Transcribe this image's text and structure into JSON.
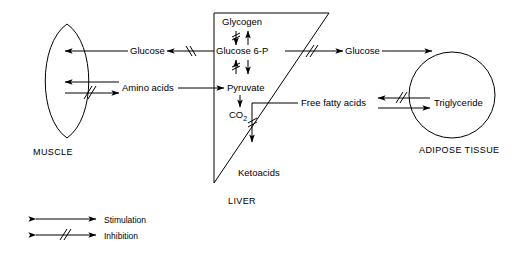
{
  "diagram": {
    "title_visible": false,
    "organs": [
      {
        "id": "muscle",
        "label": "MUSCLE"
      },
      {
        "id": "liver",
        "label": "LIVER"
      },
      {
        "id": "adipose",
        "label": "ADIPOSE TISSUE"
      }
    ],
    "metabolites": [
      {
        "id": "glucose-muscle",
        "label": "Glucose"
      },
      {
        "id": "amino-acids",
        "label": "Amino acids"
      },
      {
        "id": "glycogen",
        "label": "Glycogen"
      },
      {
        "id": "glucose-6-p",
        "label": "Glucose 6-P"
      },
      {
        "id": "pyruvate",
        "label": "Pyruvate"
      },
      {
        "id": "co2",
        "label": "CO",
        "subscript": "2"
      },
      {
        "id": "ketoacids",
        "label": "Ketoacids"
      },
      {
        "id": "glucose-adipose",
        "label": "Glucose"
      },
      {
        "id": "free-fatty-acids",
        "label": "Free fatty acids"
      },
      {
        "id": "triglyceride",
        "label": "Triglyceride"
      }
    ],
    "legend": [
      {
        "id": "stimulation",
        "label": "Stimulation",
        "marker": "arrow"
      },
      {
        "id": "inhibition",
        "label": "Inhibition",
        "marker": "arrow-hatched"
      }
    ],
    "arrows": [
      {
        "id": "g6p-to-glucose-muscle",
        "from": "glucose-6-p",
        "to": "glucose-muscle",
        "type": "inhibition"
      },
      {
        "id": "glucose-muscle-to-muscle",
        "from": "glucose-muscle",
        "to": "muscle",
        "type": "stimulation"
      },
      {
        "id": "aminoacids-to-pyruvate",
        "from": "amino-acids",
        "to": "pyruvate",
        "type": "stimulation"
      },
      {
        "id": "muscle-to-aminoacids",
        "from": "muscle",
        "to": "amino-acids",
        "type": "stimulation"
      },
      {
        "id": "aminoacids-to-muscle",
        "from": "amino-acids",
        "to": "muscle",
        "type": "inhibition"
      },
      {
        "id": "g6p-to-glycogen",
        "from": "glucose-6-p",
        "to": "glycogen",
        "type": "inhibition"
      },
      {
        "id": "glycogen-to-g6p",
        "from": "glycogen",
        "to": "glucose-6-p",
        "type": "stimulation"
      },
      {
        "id": "pyruvate-to-g6p",
        "from": "pyruvate",
        "to": "glucose-6-p",
        "type": "inhibition"
      },
      {
        "id": "g6p-to-pyruvate",
        "from": "glucose-6-p",
        "to": "pyruvate",
        "type": "stimulation"
      },
      {
        "id": "pyruvate-to-co2",
        "from": "pyruvate",
        "to": "co2",
        "type": "stimulation"
      },
      {
        "id": "ffa-to-ketoacids",
        "from": "free-fatty-acids",
        "to": "ketoacids",
        "type": "inhibition"
      },
      {
        "id": "g6p-to-glucose-adipose",
        "from": "glucose-6-p",
        "to": "glucose-adipose",
        "type": "inhibition"
      },
      {
        "id": "glucose-adipose-to-adipose",
        "from": "glucose-adipose",
        "to": "adipose",
        "type": "stimulation"
      },
      {
        "id": "triglyceride-to-ffa",
        "from": "triglyceride",
        "to": "free-fatty-acids",
        "type": "inhibition"
      },
      {
        "id": "ffa-to-triglyceride",
        "from": "free-fatty-acids",
        "to": "triglyceride",
        "type": "stimulation"
      }
    ]
  },
  "colors": {
    "stroke": "#000000",
    "background": "#ffffff",
    "text": "#000000"
  }
}
